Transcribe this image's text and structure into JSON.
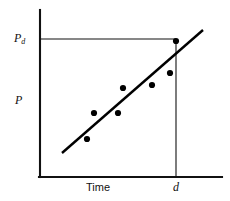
{
  "figure": {
    "caption_present": false,
    "background_color": "#ffffff",
    "ink_color": "#000000"
  },
  "labels": {
    "y_axis_label": "P",
    "y_marker_label_base": "P",
    "y_marker_label_sub": "d",
    "x_axis_label": "Time",
    "x_marker_label": "d"
  },
  "chart_data": {
    "type": "scatter",
    "title": "",
    "subtitle": "",
    "xlabel": "Time",
    "ylabel": "P",
    "grid": false,
    "legend": null,
    "xlim": [
      0,
      10
    ],
    "ylim": [
      0,
      10
    ],
    "axis_ticks": {
      "x": [
        "d"
      ],
      "y": [
        "Pd"
      ]
    },
    "annotations": [
      {
        "name": "pd-horizontal-guide",
        "text": "Pd",
        "type": "horizontal-reference-line",
        "y": 8.25,
        "x_from": 0,
        "x_to": 8.3
      },
      {
        "name": "d-vertical-guide",
        "text": "d",
        "type": "vertical-reference-line",
        "x": 8.3,
        "y_from": 0,
        "y_to": 8.25
      }
    ],
    "series": [
      {
        "name": "observations",
        "type": "scatter",
        "marker": "filled-circle",
        "color": "#000000",
        "points": [
          {
            "x": 2.58,
            "y": 2.29
          },
          {
            "x": 2.97,
            "y": 3.86
          },
          {
            "x": 4.29,
            "y": 3.86
          },
          {
            "x": 4.56,
            "y": 5.36
          },
          {
            "x": 6.15,
            "y": 5.54
          },
          {
            "x": 7.14,
            "y": 6.26
          },
          {
            "x": 8.3,
            "y": 8.19
          }
        ]
      },
      {
        "name": "fitted-trend-line",
        "type": "line",
        "color": "#000000",
        "endpoints": [
          {
            "x": 1.21,
            "y": 1.45
          },
          {
            "x": 8.9,
            "y": 8.74
          }
        ]
      }
    ]
  },
  "geometry": {
    "y_axis": {
      "x": 40,
      "y_top": 10,
      "y_bottom": 177
    },
    "x_axis": {
      "y": 177,
      "x_left": 39,
      "x_right": 222
    },
    "pd_guide": {
      "y": 39,
      "x_from": 40,
      "x_to": 176
    },
    "d_guide": {
      "x": 176,
      "y_from": 39,
      "y_to": 177
    },
    "trend": {
      "x1": 62,
      "y1": 153,
      "x2": 203,
      "y2": 30
    },
    "point_radius": 3.1,
    "points_px": [
      {
        "cx": 87,
        "cy": 139
      },
      {
        "cx": 94,
        "cy": 113
      },
      {
        "cx": 118,
        "cy": 113
      },
      {
        "cx": 123,
        "cy": 88
      },
      {
        "cx": 152,
        "cy": 85
      },
      {
        "cx": 170,
        "cy": 73
      },
      {
        "cx": 176,
        "cy": 41
      }
    ]
  }
}
